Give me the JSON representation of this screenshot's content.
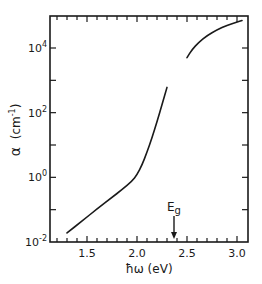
{
  "chart_data": {
    "type": "line",
    "title": "",
    "xlabel": "ħω (eV)",
    "ylabel": "α (cm⁻¹)",
    "xlim": [
      1.2,
      3.1
    ],
    "ylim_log10": [
      -2,
      5
    ],
    "y_scale": "log",
    "x_ticks": [
      {
        "value": 1.5,
        "label": "1.5"
      },
      {
        "value": 2.0,
        "label": "2.0"
      },
      {
        "value": 2.5,
        "label": "2.5"
      },
      {
        "value": 3.0,
        "label": "3.0"
      }
    ],
    "y_ticks": [
      {
        "log10": -2,
        "base": "10",
        "exp": "-2"
      },
      {
        "log10": 0,
        "base": "10",
        "exp": "0"
      },
      {
        "log10": 2,
        "base": "10",
        "exp": "2"
      },
      {
        "log10": 4,
        "base": "10",
        "exp": "4"
      }
    ],
    "grid": false,
    "legend": null,
    "series": [
      {
        "name": "below-gap absorption",
        "x": [
          1.3,
          1.45,
          1.6,
          1.75,
          1.85,
          1.95,
          2.0,
          2.05,
          2.1,
          2.15,
          2.2,
          2.25,
          2.3
        ],
        "log10_y": [
          -1.72,
          -1.35,
          -0.98,
          -0.62,
          -0.38,
          -0.12,
          0.08,
          0.38,
          0.78,
          1.22,
          1.72,
          2.25,
          2.78
        ]
      },
      {
        "name": "above-gap absorption",
        "x": [
          2.5,
          2.55,
          2.62,
          2.7,
          2.8,
          2.9,
          3.0,
          3.05
        ],
        "log10_y": [
          3.7,
          3.95,
          4.18,
          4.38,
          4.56,
          4.7,
          4.8,
          4.85
        ]
      }
    ],
    "annotations": [
      {
        "text": "E",
        "subscript": "g",
        "x": 2.37,
        "type": "arrow-down"
      }
    ]
  },
  "labels": {
    "ylabel_alpha": "α",
    "ylabel_unit": "(cm",
    "ylabel_exp": "-1",
    "ylabel_close": ")",
    "xlabel": "ħω (eV)",
    "eg_main": "E",
    "eg_sub": "g"
  }
}
